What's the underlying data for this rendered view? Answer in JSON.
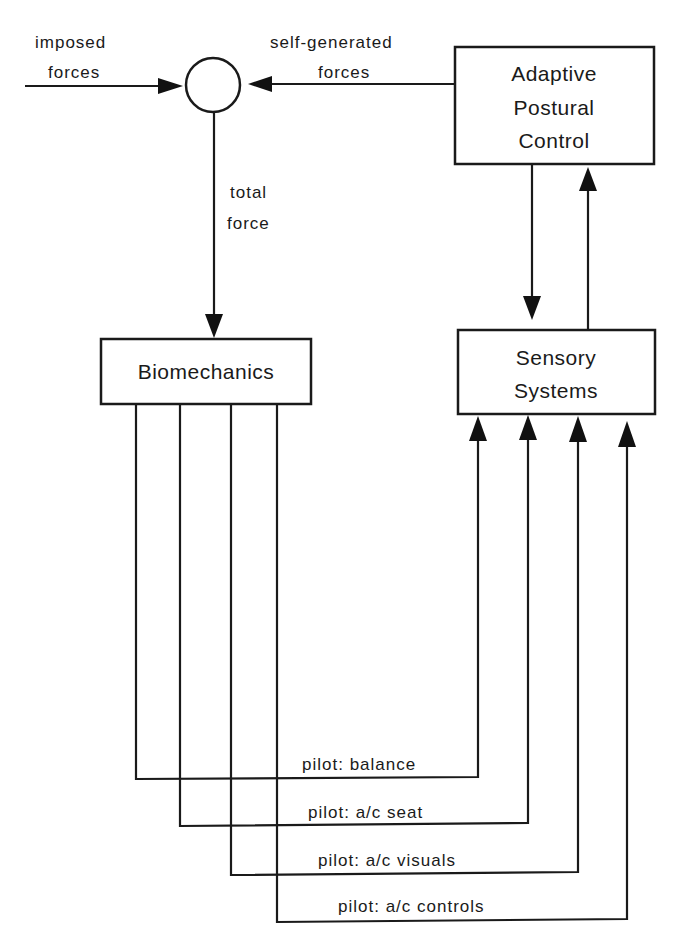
{
  "diagram": {
    "summing_junction": {
      "name": "summing-junction"
    },
    "inputs": {
      "imposed": {
        "line1": "imposed",
        "line2": "forces"
      },
      "self_generated": {
        "line1": "self-generated",
        "line2": "forces"
      },
      "total": {
        "line1": "total",
        "line2": "force"
      }
    },
    "boxes": {
      "adaptive": {
        "line1": "Adaptive",
        "line2": "Postural",
        "line3": "Control"
      },
      "biomechanics": {
        "label": "Biomechanics"
      },
      "sensory": {
        "line1": "Sensory",
        "line2": "Systems"
      }
    },
    "feedback_paths": [
      {
        "label": "pilot:  balance"
      },
      {
        "label": "pilot:  a/c  seat"
      },
      {
        "label": "pilot:  a/c  visuals"
      },
      {
        "label": "pilot:  a/c  controls"
      }
    ],
    "colors": {
      "line": "#1a1a1a",
      "background": "#ffffff"
    }
  }
}
